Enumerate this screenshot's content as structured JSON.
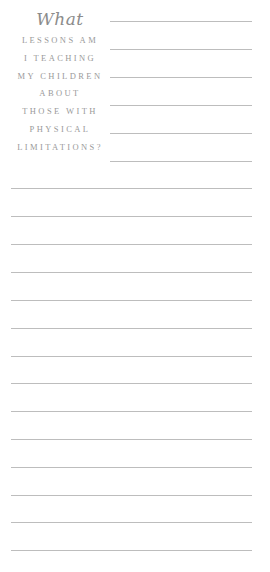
{
  "prompt": {
    "script_word": "What",
    "lines": [
      "LESSONS AM",
      "I TEACHING",
      "MY CHILDREN",
      "ABOUT",
      "THOSE WITH",
      "PHYSICAL",
      "LIMITATIONS?"
    ]
  },
  "colors": {
    "text": "#9a9a9a",
    "rule": "#bdbdbd",
    "background": "#ffffff"
  },
  "short_lines_y": [
    21,
    49,
    77,
    105,
    133,
    161
  ],
  "full_lines_y": [
    188,
    216,
    244,
    272,
    300,
    328,
    356,
    383,
    411,
    439,
    467,
    495,
    522,
    550
  ]
}
